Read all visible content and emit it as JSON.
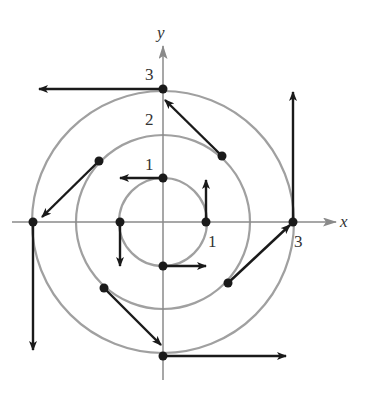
{
  "diagram": {
    "axes": {
      "x_label": "x",
      "y_label": "y",
      "x_ticks": [
        {
          "value": 1,
          "label": "1"
        },
        {
          "value": 3,
          "label": "3"
        }
      ],
      "y_ticks": [
        {
          "value": 1,
          "label": "1"
        },
        {
          "value": 2,
          "label": "2"
        },
        {
          "value": 3,
          "label": "3"
        }
      ]
    },
    "circles": [
      {
        "radius": 1
      },
      {
        "radius": 2
      },
      {
        "radius": 3
      }
    ],
    "vectors": [
      {
        "point": [
          1,
          0
        ],
        "direction": "up"
      },
      {
        "point": [
          0,
          1
        ],
        "direction": "left"
      },
      {
        "point": [
          -1,
          0
        ],
        "direction": "down"
      },
      {
        "point": [
          0,
          -1
        ],
        "direction": "right"
      },
      {
        "point": [
          1.41,
          1.41
        ],
        "direction": "up-left"
      },
      {
        "point": [
          -1.41,
          1.41
        ],
        "direction": "down-left"
      },
      {
        "point": [
          -1.41,
          -1.41
        ],
        "direction": "down-right"
      },
      {
        "point": [
          1.41,
          -1.41
        ],
        "direction": "up-right"
      },
      {
        "point": [
          3,
          0
        ],
        "direction": "up"
      },
      {
        "point": [
          0,
          3
        ],
        "direction": "left"
      },
      {
        "point": [
          -3,
          0
        ],
        "direction": "down"
      },
      {
        "point": [
          0,
          -3
        ],
        "direction": "right"
      }
    ],
    "colors": {
      "axis": "#8a8a8a",
      "circle": "#a0a0a0",
      "vector": "#1a1a1a",
      "label": "#333333"
    }
  }
}
